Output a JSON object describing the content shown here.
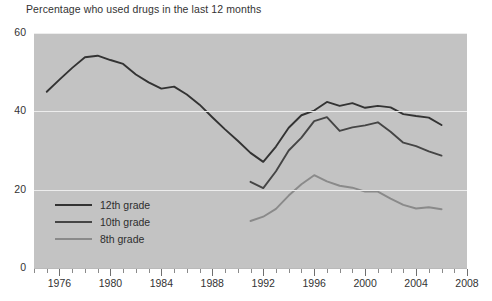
{
  "chart_data": {
    "type": "line",
    "title": "Percentage who used drugs in the last 12 months",
    "xlabel": "",
    "ylabel": "",
    "xlim": [
      1974,
      2008
    ],
    "ylim": [
      0,
      60
    ],
    "grid": true,
    "legend_position": "inside-bottom-left",
    "y_ticks": [
      0,
      20,
      40,
      60
    ],
    "y_tick_labels": [
      "0",
      "20",
      "40",
      "60"
    ],
    "x_ticks": [
      1976,
      1980,
      1984,
      1988,
      1992,
      1996,
      2000,
      2004,
      2008
    ],
    "x_tick_labels": [
      "1976",
      "1980",
      "1984",
      "1988",
      "1992",
      "1996",
      "2000",
      "2004",
      "2008"
    ],
    "x_minor_tick_step": 1,
    "plot_background": "#c3c3c3",
    "gridline_color": "#ededed",
    "series": [
      {
        "name": "12th grade",
        "color": "#333333",
        "x": [
          1975,
          1976,
          1977,
          1978,
          1979,
          1980,
          1981,
          1982,
          1983,
          1984,
          1985,
          1986,
          1987,
          1988,
          1989,
          1990,
          1991,
          1992,
          1993,
          1994,
          1995,
          1996,
          1997,
          1998,
          1999,
          2000,
          2001,
          2002,
          2003,
          2004,
          2005,
          2006
        ],
        "values": [
          45.0,
          48.1,
          51.1,
          53.8,
          54.2,
          53.1,
          52.1,
          49.4,
          47.4,
          45.8,
          46.3,
          44.3,
          41.7,
          38.5,
          35.4,
          32.5,
          29.4,
          27.1,
          31.0,
          35.8,
          39.0,
          40.2,
          42.4,
          41.4,
          42.1,
          40.9,
          41.4,
          41.0,
          39.3,
          38.8,
          38.4,
          36.5
        ]
      },
      {
        "name": "10th grade",
        "color": "#454545",
        "x": [
          1991,
          1992,
          1993,
          1994,
          1995,
          1996,
          1997,
          1998,
          1999,
          2000,
          2001,
          2002,
          2003,
          2004,
          2005,
          2006
        ],
        "values": [
          22.0,
          20.4,
          24.7,
          30.0,
          33.3,
          37.5,
          38.5,
          35.0,
          35.9,
          36.4,
          37.2,
          34.8,
          32.0,
          31.1,
          29.8,
          28.7
        ]
      },
      {
        "name": "8th grade",
        "color": "#8a8a8a",
        "x": [
          1991,
          1992,
          1993,
          1994,
          1995,
          1996,
          1997,
          1998,
          1999,
          2000,
          2001,
          2002,
          2003,
          2004,
          2005,
          2006
        ],
        "values": [
          12.0,
          13.1,
          15.1,
          18.5,
          21.4,
          23.7,
          22.1,
          21.0,
          20.5,
          19.5,
          19.5,
          17.7,
          16.1,
          15.2,
          15.5,
          15.0
        ]
      }
    ]
  },
  "legend": {
    "items": [
      {
        "label": "12th grade"
      },
      {
        "label": "10th grade"
      },
      {
        "label": "8th grade"
      }
    ]
  }
}
